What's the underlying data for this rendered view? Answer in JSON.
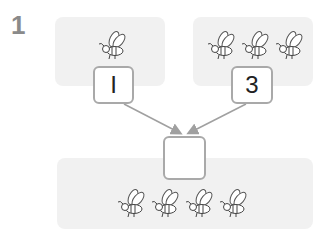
{
  "problem": {
    "number": "1",
    "left_group": {
      "count": 1,
      "value": "I"
    },
    "right_group": {
      "count": 3,
      "value": "3"
    },
    "result_group": {
      "count": 4,
      "answer": ""
    },
    "icon": "bee-icon",
    "colors": {
      "panel": "#f1f1f1",
      "box_border": "#a9a9a9",
      "arrow": "#a0a0a0",
      "number": "#8a8a8a"
    }
  }
}
